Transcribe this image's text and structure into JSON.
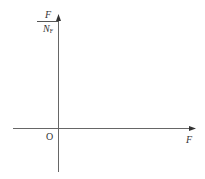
{
  "diagram": {
    "type": "coordinate-axes",
    "y_axis": {
      "label_numerator": "F",
      "label_denominator": "N",
      "label_denominator_subscript": "F"
    },
    "x_axis": {
      "label": "F"
    },
    "origin_label": "O",
    "colors": {
      "axis": "#555555",
      "text": "#333333",
      "background": "#ffffff"
    }
  }
}
